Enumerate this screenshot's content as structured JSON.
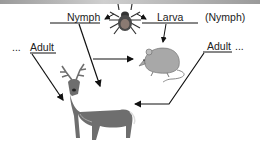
{
  "diagram": {
    "labels": {
      "nymph": "Nymph",
      "larva": "Larva",
      "nymph_paren": "(Nymph)",
      "adult_left": "Adult",
      "adult_right": "Adult",
      "ellipsis_left": "...",
      "ellipsis_right": "..."
    },
    "nodes": [
      {
        "id": "tick",
        "icon": "tick-icon"
      },
      {
        "id": "mouse",
        "icon": "mouse-icon"
      },
      {
        "id": "deer",
        "icon": "deer-icon"
      }
    ],
    "edges": [
      {
        "from": "tick",
        "to": "Nymph"
      },
      {
        "from": "tick",
        "to": "Larva"
      },
      {
        "from": "Larva",
        "to": "mouse"
      },
      {
        "from": "Nymph",
        "to": "mouse"
      },
      {
        "from": "Nymph",
        "to": "deer"
      },
      {
        "from": "Adult (left)",
        "to": "deer"
      },
      {
        "from": "Adult (right)",
        "to": "deer"
      }
    ],
    "colors": {
      "line": "#111111",
      "animal": "#6e6e6e",
      "animal_light": "#a8a8a8"
    }
  }
}
